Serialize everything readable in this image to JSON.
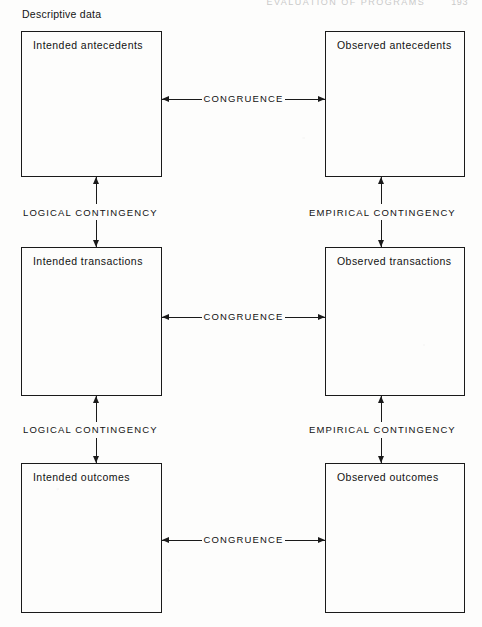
{
  "page": {
    "running_head": "EVALUATION OF PROGRAMS",
    "folio": "193",
    "section_caption": "Descriptive data"
  },
  "boxes": [
    {
      "id": "intended-antecedents",
      "label": "Intended antecedents",
      "column": "intended",
      "row": "antecedents"
    },
    {
      "id": "observed-antecedents",
      "label": "Observed antecedents",
      "column": "observed",
      "row": "antecedents"
    },
    {
      "id": "intended-transactions",
      "label": "Intended transactions",
      "column": "intended",
      "row": "transactions"
    },
    {
      "id": "observed-transactions",
      "label": "Observed transactions",
      "column": "observed",
      "row": "transactions"
    },
    {
      "id": "intended-outcomes",
      "label": "Intended outcomes",
      "column": "intended",
      "row": "outcomes"
    },
    {
      "id": "observed-outcomes",
      "label": "Observed outcomes",
      "column": "observed",
      "row": "outcomes"
    }
  ],
  "horizontal_connectors": [
    {
      "id": "congruence-antecedents",
      "label": "CONGRUENCE",
      "from": "intended-antecedents",
      "to": "observed-antecedents",
      "arrows": "both"
    },
    {
      "id": "congruence-transactions",
      "label": "CONGRUENCE",
      "from": "intended-transactions",
      "to": "observed-transactions",
      "arrows": "both"
    },
    {
      "id": "congruence-outcomes",
      "label": "CONGRUENCE",
      "from": "intended-outcomes",
      "to": "observed-outcomes",
      "arrows": "both"
    }
  ],
  "vertical_connectors": [
    {
      "id": "logical-contingency-1",
      "label": "LOGICAL CONTINGENCY",
      "from": "intended-antecedents",
      "to": "intended-transactions",
      "arrows": "both"
    },
    {
      "id": "empirical-contingency-1",
      "label": "EMPIRICAL CONTINGENCY",
      "from": "observed-antecedents",
      "to": "observed-transactions",
      "arrows": "both"
    },
    {
      "id": "logical-contingency-2",
      "label": "LOGICAL CONTINGENCY",
      "from": "intended-transactions",
      "to": "intended-outcomes",
      "arrows": "both"
    },
    {
      "id": "empirical-contingency-2",
      "label": "EMPIRICAL CONTINGENCY",
      "from": "observed-transactions",
      "to": "observed-outcomes",
      "arrows": "both"
    }
  ],
  "colors": {
    "ink": "#1a1a1a",
    "paper": "#fdfdfc"
  }
}
